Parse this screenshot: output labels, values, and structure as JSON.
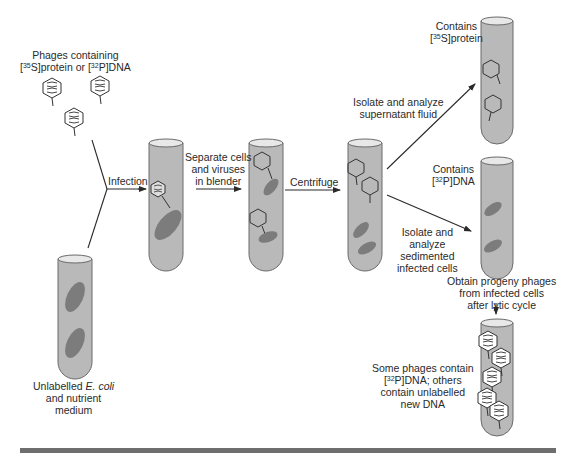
{
  "figure": {
    "colors": {
      "tube_fill": "#b9b9b9",
      "tube_outline": "#6a6a6a",
      "cell_fill": "#7c7c7c",
      "line": "#2a2a2a",
      "bottom_bar": "#6e6e6e"
    }
  },
  "labels": {
    "phages": {
      "line1": "Phages containing",
      "line2_pre": "[",
      "sup1": "35",
      "mid1": "S]protein or [",
      "sup2": "32",
      "post": "P]DNA"
    },
    "ecoli": {
      "line1_pre": "Unlabelled ",
      "line1_italic": "E. coli",
      "line2": "and nutrient",
      "line3": "medium"
    },
    "infection": "Infection",
    "blender": {
      "line1": "Separate cells",
      "line2": "and viruses",
      "line3": "in blender"
    },
    "centrifuge": "Centrifuge",
    "supernatant": {
      "line1": "Isolate and analyze",
      "line2": "supernatant fluid"
    },
    "contains_protein": {
      "line1": "Contains",
      "line2_pre": "[",
      "sup": "35",
      "line2_post": "S]protein"
    },
    "contains_dna": {
      "line1": "Contains",
      "line2_pre": "[",
      "sup": "32",
      "line2_post": "P]DNA"
    },
    "sediment": {
      "line1": "Isolate and",
      "line2": "analyze",
      "line3": "sedimented",
      "line4": "infected cells"
    },
    "progeny": {
      "line1": "Obtain progeny phages",
      "line2": "from infected cells",
      "line3": "after lytic cycle"
    },
    "result": {
      "line1": "Some phages contain",
      "line2_pre": "[",
      "sup": "32",
      "line2_post": "P]DNA; others",
      "line3": "contain unlabelled",
      "line4": "new DNA"
    }
  }
}
